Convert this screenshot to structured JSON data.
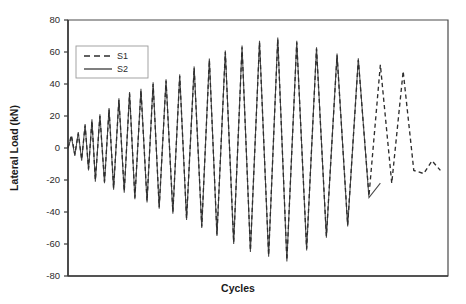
{
  "chart_data": {
    "type": "line",
    "title": "",
    "xlabel": "Cycles",
    "ylabel": "Lateral Load (kN)",
    "ylim": [
      -80,
      80
    ],
    "yticks": [
      80,
      60,
      40,
      20,
      0,
      -20,
      -40,
      -60,
      -80
    ],
    "ytick_labels": [
      "80",
      "60",
      "40",
      "20",
      "0",
      "-20",
      "-40",
      "-60",
      "-80"
    ],
    "xlim": [
      0,
      100
    ],
    "xticks": [],
    "xtick_labels": [],
    "grid": false,
    "legend_position": "upper-left",
    "legend": [
      "S1",
      "S2"
    ],
    "series": [
      {
        "name": "S1",
        "style": "dashed",
        "color": "#2e2e2e",
        "description": "Cyclic lateral load history, specimen S1; amplitude grows then degrades after peak, extends beyond S2",
        "x": [
          0.0,
          0.9,
          1.8,
          2.7,
          3.6,
          4.5,
          5.4,
          6.3,
          7.2,
          8.4,
          9.6,
          10.8,
          12.0,
          13.4,
          14.8,
          16.2,
          17.6,
          19.2,
          20.8,
          22.4,
          24.0,
          25.8,
          27.6,
          29.4,
          31.2,
          33.2,
          35.2,
          37.2,
          39.2,
          41.4,
          43.6,
          45.8,
          48.0,
          50.4,
          52.8,
          55.2,
          57.6,
          60.2,
          62.8,
          65.4,
          68.0,
          70.8,
          73.6,
          76.4,
          79.2,
          82.2,
          85.2,
          88.2,
          91.0,
          93.6,
          95.8,
          98.0
        ],
        "y": [
          0,
          8,
          -4,
          9,
          -7,
          14,
          -13,
          17,
          -20,
          20,
          -21,
          24,
          -25,
          30,
          -27,
          34,
          -31,
          36,
          -33,
          40,
          -37,
          42,
          -40,
          45,
          -44,
          50,
          -49,
          55,
          -54,
          60,
          -59,
          63,
          -64,
          66,
          -67,
          68,
          -70,
          66,
          -63,
          62,
          -55,
          58,
          -48,
          55,
          -30,
          52,
          -22,
          48,
          -14,
          -16,
          -8,
          -14
        ]
      },
      {
        "name": "S2",
        "style": "solid",
        "color": "#4a4a4a",
        "description": "Cyclic lateral load history, specimen S2; nearly identical to S1 early, terminates earlier after strength loss",
        "x": [
          0.0,
          0.9,
          1.8,
          2.7,
          3.6,
          4.5,
          5.4,
          6.3,
          7.2,
          8.4,
          9.6,
          10.8,
          12.0,
          13.4,
          14.8,
          16.2,
          17.6,
          19.2,
          20.8,
          22.4,
          24.0,
          25.8,
          27.6,
          29.4,
          31.2,
          33.2,
          35.2,
          37.2,
          39.2,
          41.4,
          43.6,
          45.8,
          48.0,
          50.4,
          52.8,
          55.2,
          57.6,
          60.2,
          62.8,
          65.4,
          68.0,
          70.8,
          73.6,
          76.4,
          79.2,
          82.2
        ],
        "y": [
          0,
          7,
          -5,
          10,
          -8,
          15,
          -14,
          18,
          -21,
          21,
          -22,
          25,
          -26,
          31,
          -28,
          35,
          -32,
          37,
          -34,
          41,
          -38,
          43,
          -41,
          46,
          -45,
          51,
          -50,
          56,
          -55,
          61,
          -60,
          64,
          -65,
          67,
          -68,
          69,
          -71,
          67,
          -64,
          63,
          -56,
          59,
          -49,
          56,
          -31,
          -22
        ]
      }
    ]
  },
  "legend": {
    "items": [
      {
        "label": "S1",
        "style": "dashed"
      },
      {
        "label": "S2",
        "style": "solid"
      }
    ]
  }
}
